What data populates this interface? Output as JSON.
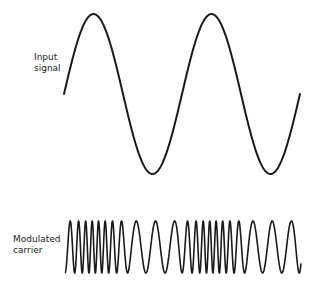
{
  "labels": {
    "input_line1": "Input",
    "input_line2": "signal",
    "carrier_line1": "Modulated",
    "carrier_line2": "carrier"
  },
  "colors": {
    "stroke": "#1a1a1a",
    "background": "#ffffff"
  },
  "input_signal": {
    "x_start": 64,
    "x_end": 300,
    "center_y": 94,
    "amplitude": 80,
    "cycles": 2.0,
    "phase_start": "mid-rising"
  },
  "modulated_carrier": {
    "x_start": 65,
    "x_end": 301,
    "center_y": 247,
    "amplitude": 26,
    "base_cycles": 34,
    "modulation": "frequency",
    "dense_regions_x": [
      92,
      210
    ]
  }
}
